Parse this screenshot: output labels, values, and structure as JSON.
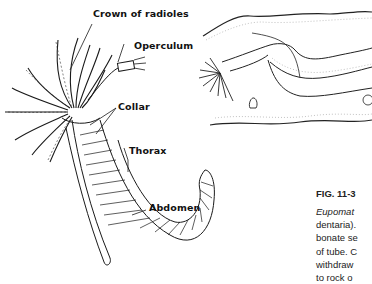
{
  "figure": {
    "labels": {
      "crown": "Crown of radioles",
      "operculum": "Operculum",
      "collar": "Collar",
      "thorax": "Thorax",
      "abdomen": "Abdomen"
    },
    "title": "FIG. 11-3",
    "caption_lines": [
      "Eupomat",
      "dentaria).",
      "bonate se",
      "of tube. C",
      "withdraw",
      "to rock o"
    ]
  },
  "colors": {
    "ink": "#1a1a1a",
    "stipple": "#888888",
    "background": "#ffffff"
  }
}
